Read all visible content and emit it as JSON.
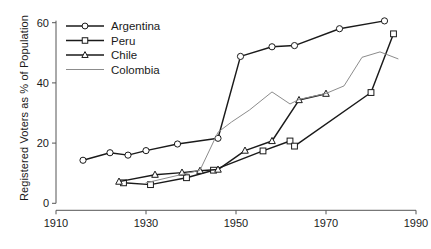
{
  "chart_data": {
    "type": "line",
    "title": "",
    "xlabel": "",
    "ylabel": "Registered Voters as % of Population",
    "xlim": [
      1910,
      1990
    ],
    "ylim": [
      0,
      62
    ],
    "xticks": [
      1910,
      1930,
      1950,
      1970,
      1990
    ],
    "yticks": [
      0,
      20,
      40,
      60
    ],
    "xtick_labels": [
      "1910",
      "1930",
      "1950",
      "1970",
      "1990"
    ],
    "ytick_labels": [
      "0",
      "20",
      "40",
      "60"
    ],
    "grid": false,
    "legend_position": "top-left",
    "series": [
      {
        "name": "Argentina",
        "marker": "circle",
        "color": "#1a1a1a",
        "points": [
          [
            1916,
            14.3
          ],
          [
            1922,
            16.8
          ],
          [
            1926,
            16.0
          ],
          [
            1930,
            17.5
          ],
          [
            1937,
            19.7
          ],
          [
            1946,
            21.6
          ],
          [
            1951,
            48.8
          ],
          [
            1958,
            52.0
          ],
          [
            1963,
            52.4
          ],
          [
            1973,
            58.0
          ],
          [
            1983,
            60.6
          ]
        ]
      },
      {
        "name": "Peru",
        "marker": "square",
        "color": "#1a1a1a",
        "points": [
          [
            1925,
            6.8
          ],
          [
            1931,
            6.2
          ],
          [
            1939,
            8.5
          ],
          [
            1945,
            11.0
          ],
          [
            1956,
            17.4
          ],
          [
            1962,
            20.7
          ],
          [
            1963,
            19.0
          ],
          [
            1980,
            36.8
          ],
          [
            1985,
            56.3
          ]
        ]
      },
      {
        "name": "Chile",
        "marker": "triangle",
        "color": "#1a1a1a",
        "points": [
          [
            1924,
            7.2
          ],
          [
            1932,
            9.5
          ],
          [
            1938,
            10.2
          ],
          [
            1942,
            10.8
          ],
          [
            1946,
            11.2
          ],
          [
            1952,
            17.5
          ],
          [
            1958,
            20.7
          ],
          [
            1964,
            34.3
          ],
          [
            1970,
            36.4
          ]
        ]
      },
      {
        "name": "Colombia",
        "marker": "none",
        "color": "#8c8c8c",
        "points": [
          [
            1930,
            6.8
          ],
          [
            1942,
            11.0
          ],
          [
            1946,
            23.6
          ],
          [
            1949,
            27.0
          ],
          [
            1953,
            31.0
          ],
          [
            1958,
            37.0
          ],
          [
            1962,
            33.0
          ],
          [
            1964,
            34.5
          ],
          [
            1970,
            36.5
          ],
          [
            1974,
            39.0
          ],
          [
            1978,
            48.5
          ],
          [
            1982,
            50.3
          ],
          [
            1986,
            48.0
          ]
        ]
      }
    ]
  },
  "legend": {
    "entries": [
      {
        "label": "Argentina",
        "marker": "circle",
        "color": "#1a1a1a"
      },
      {
        "label": "Peru",
        "marker": "square",
        "color": "#1a1a1a"
      },
      {
        "label": "Chile",
        "marker": "triangle",
        "color": "#1a1a1a"
      },
      {
        "label": "Colombia",
        "marker": "none",
        "color": "#8c8c8c"
      }
    ]
  },
  "colors": {
    "axis": "#555555",
    "text": "#1a1a1a",
    "dark_series": "#1a1a1a",
    "colombia": "#8c8c8c",
    "background": "#ffffff"
  }
}
